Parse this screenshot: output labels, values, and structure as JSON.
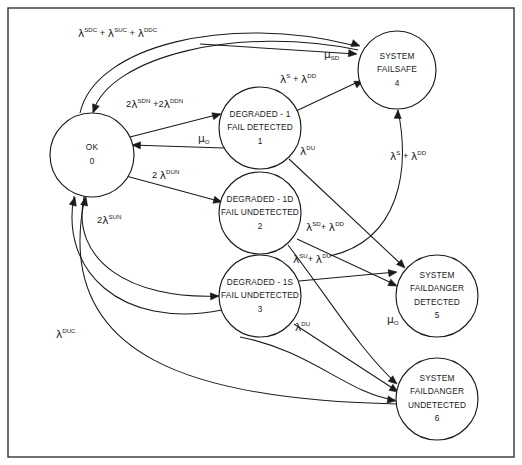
{
  "diagram": {
    "canvas": {
      "width": 522,
      "height": 465
    },
    "border": {
      "x": 8,
      "y": 8,
      "width": 506,
      "height": 449,
      "color": "#333333"
    },
    "stroke_color": "#1a1a1a",
    "background": "#ffffff"
  },
  "nodes": [
    {
      "id": "state-0",
      "index": "0",
      "lines": [
        "OK"
      ],
      "cx": 92,
      "cy": 155,
      "r": 42
    },
    {
      "id": "state-1",
      "index": "1",
      "lines": [
        "DEGRADED - 1",
        "FAIL DETECTED"
      ],
      "cx": 260,
      "cy": 128,
      "r": 41
    },
    {
      "id": "state-2",
      "index": "2",
      "lines": [
        "DEGRADED - 1D",
        "FAIL UNDETECTED"
      ],
      "cx": 260,
      "cy": 213,
      "r": 41
    },
    {
      "id": "state-3",
      "index": "3",
      "lines": [
        "DEGRADED - 1S",
        "FAIL UNDETECTED"
      ],
      "cx": 260,
      "cy": 296,
      "r": 41
    },
    {
      "id": "state-4",
      "index": "4",
      "lines": [
        "SYSTEM",
        "FAILSAFE"
      ],
      "cx": 397,
      "cy": 70,
      "r": 39
    },
    {
      "id": "state-5",
      "index": "5",
      "lines": [
        "SYSTEM",
        "FAILDANGER",
        "DETECTED"
      ],
      "cx": 437,
      "cy": 296,
      "r": 41
    },
    {
      "id": "state-6",
      "index": "6",
      "lines": [
        "SYSTEM",
        "FAILDANGER",
        "UNDETECTED"
      ],
      "cx": 437,
      "cy": 399,
      "r": 41
    }
  ],
  "edges": [
    {
      "id": "edge-0-4",
      "from": "state-0",
      "to": "state-4",
      "label_html": "<tspan class=\"gk\">&#955;</tspan><tspan class=\"sup\">SDC</tspan> + <tspan class=\"gk\">&#955;</tspan><tspan class=\"sup\">SUC</tspan> + <tspan class=\"gk\">&#955;</tspan><tspan class=\"sup\">DDC</tspan>",
      "label_text": "λSDC + λSUC + λDDC",
      "label_x": 78,
      "label_y": 34,
      "path": "M 80 113 C 95 45 230 14 352 45"
    },
    {
      "id": "edge-4-0",
      "from": "state-4",
      "to": "state-0",
      "label_html": "",
      "label_text": "",
      "label_x": 0,
      "label_y": 0,
      "path": "M 358 50 C 240 25 110 56 93 112"
    },
    {
      "id": "edge-0-1",
      "from": "state-0",
      "to": "state-1",
      "label_html": "2<tspan class=\"gk\">&#955;</tspan><tspan class=\"sup\">SDN</tspan> +2<tspan class=\"gk\">&#955;</tspan><tspan class=\"sup\">DDN</tspan>",
      "label_text": "2λSDN +2λDDN",
      "label_x": 126,
      "label_y": 105,
      "path": "M 130 137 L 220 114"
    },
    {
      "id": "edge-1-0",
      "from": "state-1",
      "to": "state-0",
      "label_html": "<tspan class=\"gk\">&#956;</tspan><tspan class=\"sub\">O</tspan>",
      "label_text": "μO",
      "label_x": 198,
      "label_y": 139,
      "path": "M 224 148 L 131 145"
    },
    {
      "id": "edge-0-2",
      "from": "state-0",
      "to": "state-2",
      "label_html": "2 <tspan class=\"gk\">&#955;</tspan><tspan class=\"sup\">DUN</tspan>",
      "label_text": "2 λDUN",
      "label_x": 152,
      "label_y": 176,
      "path": "M 126 176 L 222 202"
    },
    {
      "id": "edge-0-3",
      "from": "state-0",
      "to": "state-3",
      "label_html": "2<tspan class=\"gk\">&#955;</tspan><tspan class=\"sup\">SUN</tspan>",
      "label_text": "2λSUN",
      "label_x": 97,
      "label_y": 221,
      "path": "M 84 197 C 70 260 130 300 219 296"
    },
    {
      "id": "edge-3-0-return",
      "from": "state-3",
      "to": "state-0",
      "label_html": "",
      "label_text": "",
      "label_x": 0,
      "label_y": 0,
      "path": "M 222 310 C 120 330 60 270 74 196"
    },
    {
      "id": "edge-6-0",
      "from": "state-6",
      "to": "state-0",
      "label_html": "<tspan class=\"gk\">&#955;</tspan><tspan class=\"sup\">DUC</tspan>",
      "label_text": "λDUC",
      "label_x": 56,
      "label_y": 335,
      "path": "M 397 404 C 200 400 50 360 85 197"
    },
    {
      "id": "edge-1-4",
      "from": "state-1",
      "to": "state-4",
      "label_html": "<tspan class=\"gk\">&#955;</tspan><tspan class=\"sup\">S</tspan> + <tspan class=\"gk\">&#955;</tspan><tspan class=\"sup\">DD</tspan>",
      "label_text": "λS + λDD",
      "label_x": 280,
      "label_y": 80,
      "path": "M 296 111 L 362 80"
    },
    {
      "id": "edge-4-1",
      "from": "state-4",
      "to": "state-1",
      "label_html": "<tspan class=\"gk\">&#956;</tspan><tspan class=\"sub\">SD</tspan>",
      "label_text": "μSD",
      "label_x": 324,
      "label_y": 55,
      "path": "M 200 44 L 356 54"
    },
    {
      "id": "edge-1-5",
      "from": "state-1",
      "to": "state-5",
      "label_html": "<tspan class=\"gk\">&#955;</tspan><tspan class=\"sup\">DU</tspan>",
      "label_text": "λDU",
      "label_x": 300,
      "label_y": 152,
      "path": "M 289 159 L 404 267"
    },
    {
      "id": "edge-2-4",
      "from": "state-2",
      "to": "state-4",
      "label_html": "<tspan class=\"gk\">&#955;</tspan><tspan class=\"sup\">S</tspan> + <tspan class=\"gk\">&#955;</tspan><tspan class=\"sup\">DD</tspan>",
      "label_text": "λS + λDD",
      "label_x": 390,
      "label_y": 157,
      "path": "M 330 256 C 400 240 410 170 398 110"
    },
    {
      "id": "edge-2-5",
      "from": "state-2",
      "to": "state-5",
      "label_html": "<tspan class=\"gk\">&#955;</tspan><tspan class=\"sup\">SD</tspan>+ <tspan class=\"gk\">&#955;</tspan><tspan class=\"sup\">DD</tspan>",
      "label_text": "λSD+ λDD",
      "label_x": 306,
      "label_y": 228,
      "path": "M 297 239 L 396 285"
    },
    {
      "id": "edge-2-6",
      "from": "state-2",
      "to": "state-6",
      "label_html": "<tspan class=\"gk\">&#955;</tspan><tspan class=\"sup\">SU</tspan>+ <tspan class=\"gk\">&#955;</tspan><tspan class=\"sup\">DU</tspan>",
      "label_text": "λSU+ λDU",
      "label_x": 293,
      "label_y": 260,
      "path": "M 288 245 C 330 300 360 350 396 383"
    },
    {
      "id": "edge-3-5",
      "from": "state-3",
      "to": "state-5",
      "label_html": "",
      "label_text": "",
      "label_x": 0,
      "label_y": 0,
      "path": "M 299 281 L 396 272"
    },
    {
      "id": "edge-3-6",
      "from": "state-3",
      "to": "state-6",
      "label_html": "<tspan class=\"gk\">&#955;</tspan><tspan class=\"sup\">DU</tspan>",
      "label_text": "λDU",
      "label_x": 295,
      "label_y": 328,
      "path": "M 294 324 L 397 391"
    },
    {
      "id": "edge-5-6-mu",
      "from": "state-5",
      "to": "state-6",
      "label_html": "<tspan class=\"gk\">&#956;</tspan><tspan class=\"sub\">O</tspan>",
      "label_text": "μO",
      "label_x": 387,
      "label_y": 320,
      "path": "M 240 337 C 310 350 350 395 395 400"
    }
  ],
  "arrowheads": [
    {
      "id": "arrow-into-0-top",
      "x": 93,
      "y": 113,
      "angle": 110
    },
    {
      "id": "arrow-into-1-left",
      "x": 221,
      "y": 114,
      "angle": 345
    },
    {
      "id": "arrow-into-0-right",
      "x": 132,
      "y": 145,
      "angle": 182
    },
    {
      "id": "arrow-into-2-left",
      "x": 222,
      "y": 202,
      "angle": 15
    },
    {
      "id": "arrow-into-3-left",
      "x": 219,
      "y": 296,
      "angle": 357
    },
    {
      "id": "arrow-into-0-bottom-a",
      "x": 75,
      "y": 197,
      "angle": 285
    },
    {
      "id": "arrow-into-0-bottom-b",
      "x": 86,
      "y": 197,
      "angle": 283
    },
    {
      "id": "arrow-into-4-left-a",
      "x": 360,
      "y": 46,
      "angle": 20
    },
    {
      "id": "arrow-into-4-left-b",
      "x": 357,
      "y": 54,
      "angle": 5
    },
    {
      "id": "arrow-into-4-topleft",
      "x": 363,
      "y": 81,
      "angle": 335
    },
    {
      "id": "arrow-into-4-bottom",
      "x": 398,
      "y": 110,
      "angle": 272
    },
    {
      "id": "arrow-into-5-topleft",
      "x": 405,
      "y": 268,
      "angle": 45
    },
    {
      "id": "arrow-into-5-left-a",
      "x": 397,
      "y": 286,
      "angle": 25
    },
    {
      "id": "arrow-into-5-left-b",
      "x": 397,
      "y": 272,
      "angle": 352
    },
    {
      "id": "arrow-into-6-a",
      "x": 397,
      "y": 384,
      "angle": 40
    },
    {
      "id": "arrow-into-6-b",
      "x": 398,
      "y": 392,
      "angle": 33
    },
    {
      "id": "arrow-into-6-c",
      "x": 396,
      "y": 401,
      "angle": 10
    }
  ]
}
